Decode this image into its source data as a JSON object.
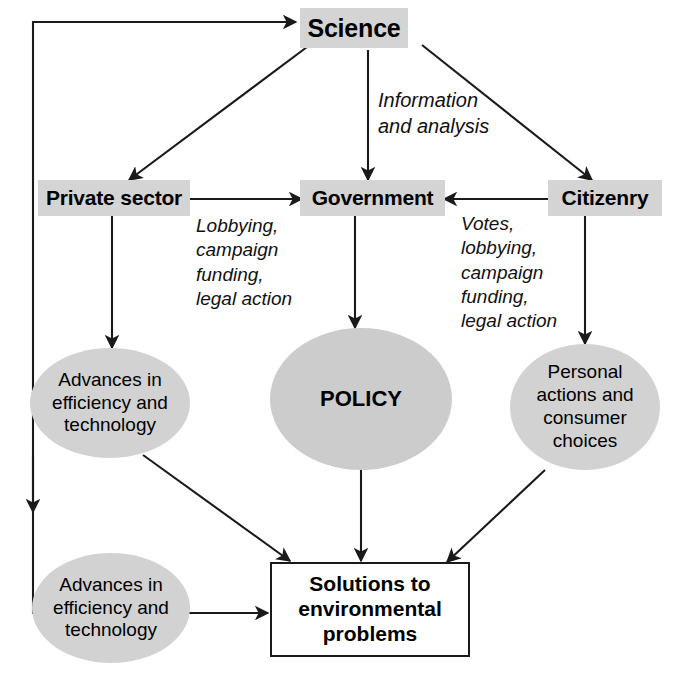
{
  "diagram": {
    "colors": {
      "node_fill_gray": "#d4d4d4",
      "ellipse_fill": "#d2d2d2",
      "policy_fill": "#cccccc",
      "stroke": "#1a1a1a",
      "text": "#000000",
      "background": "#ffffff"
    },
    "nodes": [
      {
        "id": "science",
        "label": "Science",
        "shape": "rounded-rect-gray"
      },
      {
        "id": "private",
        "label": "Private sector",
        "shape": "rounded-rect-gray"
      },
      {
        "id": "government",
        "label": "Government",
        "shape": "rounded-rect-gray"
      },
      {
        "id": "citizenry",
        "label": "Citizenry",
        "shape": "rounded-rect-gray"
      },
      {
        "id": "advances_top",
        "label": "Advances in efficiency and technology",
        "shape": "ellipse"
      },
      {
        "id": "policy",
        "label": "POLICY",
        "shape": "circle"
      },
      {
        "id": "personal",
        "label": "Personal actions and consumer choices",
        "shape": "ellipse"
      },
      {
        "id": "advances_bottom",
        "label": "Advances in efficiency and technology",
        "shape": "ellipse"
      },
      {
        "id": "solutions",
        "label": "Solutions to environmental problems",
        "shape": "rect-outline"
      }
    ],
    "edge_labels": [
      {
        "id": "info",
        "text": "Information\nand analysis"
      },
      {
        "id": "lobbying",
        "text": "Lobbying,\ncampaign\nfunding,\nlegal action"
      },
      {
        "id": "votes",
        "text": "Votes,\nlobbying,\ncampaign\nfunding,\nlegal action"
      }
    ],
    "edges": [
      {
        "from": "science",
        "to": "private",
        "label": ""
      },
      {
        "from": "science",
        "to": "government",
        "label": "Information and analysis"
      },
      {
        "from": "science",
        "to": "citizenry",
        "label": ""
      },
      {
        "from": "private",
        "to": "government",
        "label": "Lobbying, campaign funding, legal action"
      },
      {
        "from": "citizenry",
        "to": "government",
        "label": "Votes, lobbying, campaign funding, legal action"
      },
      {
        "from": "private",
        "to": "advances_top",
        "label": ""
      },
      {
        "from": "government",
        "to": "policy",
        "label": ""
      },
      {
        "from": "citizenry",
        "to": "personal",
        "label": ""
      },
      {
        "from": "advances_top",
        "to": "solutions",
        "label": ""
      },
      {
        "from": "policy",
        "to": "solutions",
        "label": ""
      },
      {
        "from": "personal",
        "to": "solutions",
        "label": ""
      },
      {
        "from": "advances_bottom",
        "to": "solutions",
        "label": ""
      },
      {
        "from": "advances_bottom",
        "to": "science",
        "label": ""
      }
    ]
  }
}
